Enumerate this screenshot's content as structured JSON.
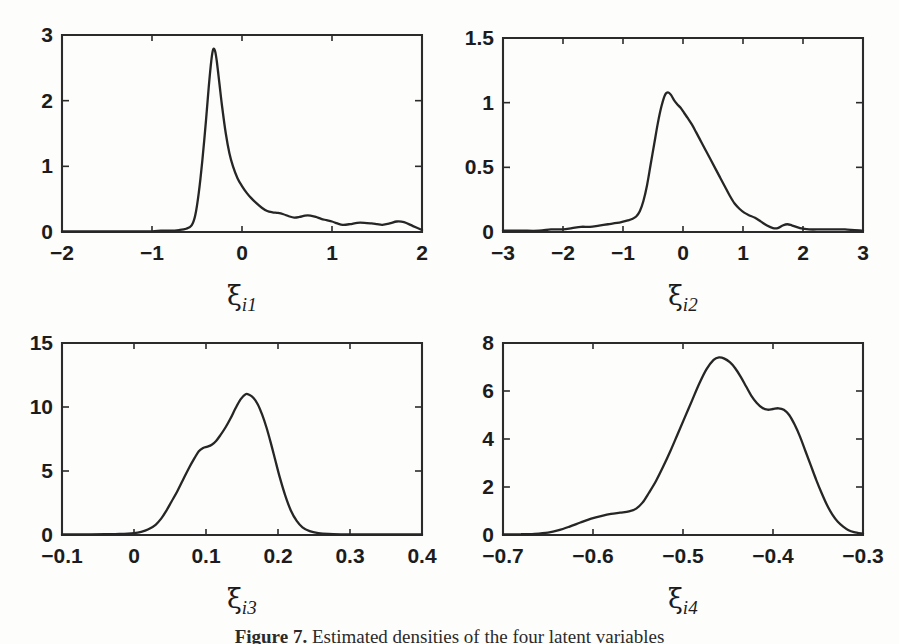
{
  "figure": {
    "background_color": "#fdfdfc",
    "line_color": "#262626",
    "caption_prefix": "Figure",
    "caption_number": "7",
    "caption_text": "Estimated densities of the four latent variables"
  },
  "chart_data": [
    {
      "type": "line",
      "title": "",
      "xlabel": "ξ_i1",
      "xlabel_symbol": "ξ",
      "xlabel_subscript": "i1",
      "ylabel": "",
      "xlim": [
        -2,
        2
      ],
      "ylim": [
        0,
        3
      ],
      "xticks": [
        -2,
        -1,
        0,
        1,
        2
      ],
      "xtick_labels": [
        "−2",
        "−1",
        "0",
        "1",
        "2"
      ],
      "yticks": [
        0,
        1,
        2,
        3
      ],
      "ytick_labels": [
        "0",
        "1",
        "2",
        "3"
      ],
      "grid": false,
      "legend": "none",
      "x": [
        -2.0,
        -1.8,
        -1.6,
        -1.4,
        -1.2,
        -1.0,
        -0.9,
        -0.8,
        -0.7,
        -0.62,
        -0.56,
        -0.52,
        -0.48,
        -0.44,
        -0.4,
        -0.37,
        -0.34,
        -0.32,
        -0.3,
        -0.28,
        -0.25,
        -0.22,
        -0.18,
        -0.14,
        -0.1,
        -0.05,
        0.0,
        0.05,
        0.1,
        0.16,
        0.22,
        0.28,
        0.34,
        0.4,
        0.46,
        0.52,
        0.58,
        0.64,
        0.7,
        0.76,
        0.82,
        0.88,
        0.94,
        1.0,
        1.06,
        1.12,
        1.2,
        1.28,
        1.36,
        1.44,
        1.5,
        1.56,
        1.64,
        1.72,
        1.8,
        1.9,
        2.0
      ],
      "y": [
        0.01,
        0.01,
        0.01,
        0.01,
        0.01,
        0.01,
        0.02,
        0.02,
        0.03,
        0.05,
        0.1,
        0.25,
        0.6,
        1.1,
        1.7,
        2.2,
        2.62,
        2.78,
        2.76,
        2.6,
        2.25,
        1.9,
        1.5,
        1.2,
        1.0,
        0.82,
        0.7,
        0.6,
        0.52,
        0.44,
        0.37,
        0.32,
        0.3,
        0.29,
        0.27,
        0.24,
        0.22,
        0.23,
        0.25,
        0.25,
        0.23,
        0.2,
        0.18,
        0.16,
        0.13,
        0.11,
        0.12,
        0.14,
        0.14,
        0.13,
        0.12,
        0.11,
        0.13,
        0.16,
        0.15,
        0.09,
        0.03
      ]
    },
    {
      "type": "line",
      "title": "",
      "xlabel": "ξ_i2",
      "xlabel_symbol": "ξ",
      "xlabel_subscript": "i2",
      "ylabel": "",
      "xlim": [
        -3,
        3
      ],
      "ylim": [
        0,
        1.5
      ],
      "xticks": [
        -3,
        -2,
        -1,
        0,
        1,
        2,
        3
      ],
      "xtick_labels": [
        "−3",
        "−2",
        "−1",
        "0",
        "1",
        "2",
        "3"
      ],
      "yticks": [
        0,
        0.5,
        1,
        1.5
      ],
      "ytick_labels": [
        "0",
        "0.5",
        "1",
        "1.5"
      ],
      "grid": false,
      "legend": "none",
      "x": [
        -3.0,
        -2.7,
        -2.4,
        -2.2,
        -2.0,
        -1.85,
        -1.7,
        -1.55,
        -1.4,
        -1.25,
        -1.1,
        -1.0,
        -0.92,
        -0.85,
        -0.78,
        -0.72,
        -0.66,
        -0.6,
        -0.54,
        -0.48,
        -0.42,
        -0.36,
        -0.3,
        -0.25,
        -0.2,
        -0.15,
        -0.1,
        -0.04,
        0.02,
        0.08,
        0.15,
        0.22,
        0.3,
        0.38,
        0.46,
        0.54,
        0.62,
        0.7,
        0.78,
        0.86,
        0.94,
        1.02,
        1.1,
        1.2,
        1.3,
        1.4,
        1.5,
        1.58,
        1.66,
        1.74,
        1.82,
        1.95,
        2.1,
        2.3,
        2.5,
        2.7,
        3.0
      ],
      "y": [
        0.01,
        0.01,
        0.01,
        0.02,
        0.02,
        0.03,
        0.04,
        0.04,
        0.05,
        0.06,
        0.07,
        0.08,
        0.09,
        0.1,
        0.12,
        0.16,
        0.24,
        0.36,
        0.52,
        0.68,
        0.84,
        0.97,
        1.06,
        1.08,
        1.06,
        1.02,
        0.99,
        0.96,
        0.92,
        0.88,
        0.83,
        0.77,
        0.7,
        0.63,
        0.56,
        0.49,
        0.42,
        0.35,
        0.28,
        0.22,
        0.18,
        0.15,
        0.13,
        0.11,
        0.08,
        0.05,
        0.03,
        0.03,
        0.05,
        0.06,
        0.05,
        0.03,
        0.02,
        0.02,
        0.02,
        0.02,
        0.01
      ]
    },
    {
      "type": "line",
      "title": "",
      "xlabel": "ξ_i3",
      "xlabel_symbol": "ξ",
      "xlabel_subscript": "i3",
      "ylabel": "",
      "xlim": [
        -0.1,
        0.4
      ],
      "ylim": [
        0,
        15
      ],
      "xticks": [
        -0.1,
        0,
        0.1,
        0.2,
        0.3,
        0.4
      ],
      "xtick_labels": [
        "−0.1",
        "0",
        "0.1",
        "0.2",
        "0.3",
        "0.4"
      ],
      "yticks": [
        0,
        5,
        10,
        15
      ],
      "ytick_labels": [
        "0",
        "5",
        "10",
        "15"
      ],
      "grid": false,
      "legend": "none",
      "x": [
        -0.1,
        -0.08,
        -0.06,
        -0.04,
        -0.02,
        0.0,
        0.01,
        0.02,
        0.03,
        0.038,
        0.045,
        0.052,
        0.06,
        0.068,
        0.076,
        0.084,
        0.09,
        0.096,
        0.102,
        0.108,
        0.114,
        0.12,
        0.127,
        0.134,
        0.141,
        0.148,
        0.155,
        0.16,
        0.166,
        0.172,
        0.178,
        0.184,
        0.19,
        0.196,
        0.202,
        0.21,
        0.218,
        0.226,
        0.234,
        0.244,
        0.256,
        0.27,
        0.29,
        0.31,
        0.34,
        0.37,
        0.4
      ],
      "y": [
        0.05,
        0.05,
        0.05,
        0.06,
        0.08,
        0.15,
        0.25,
        0.45,
        0.8,
        1.3,
        1.9,
        2.6,
        3.4,
        4.3,
        5.2,
        6.0,
        6.55,
        6.8,
        6.9,
        7.05,
        7.35,
        7.8,
        8.4,
        9.1,
        9.9,
        10.6,
        11.0,
        10.95,
        10.7,
        10.2,
        9.4,
        8.4,
        7.2,
        5.9,
        4.6,
        3.1,
        1.9,
        1.1,
        0.6,
        0.3,
        0.15,
        0.08,
        0.05,
        0.04,
        0.04,
        0.04,
        0.04
      ]
    },
    {
      "type": "line",
      "title": "",
      "xlabel": "ξ_i4",
      "xlabel_symbol": "ξ",
      "xlabel_subscript": "i4",
      "ylabel": "",
      "xlim": [
        -0.7,
        -0.3
      ],
      "ylim": [
        0,
        8
      ],
      "xticks": [
        -0.7,
        -0.6,
        -0.5,
        -0.4,
        -0.3
      ],
      "xtick_labels": [
        "−0.7",
        "−0.6",
        "−0.5",
        "−0.4",
        "−0.3"
      ],
      "yticks": [
        0,
        2,
        4,
        6,
        8
      ],
      "ytick_labels": [
        "0",
        "2",
        "4",
        "6",
        "8"
      ],
      "grid": false,
      "legend": "none",
      "x": [
        -0.7,
        -0.68,
        -0.665,
        -0.65,
        -0.638,
        -0.626,
        -0.614,
        -0.602,
        -0.59,
        -0.58,
        -0.57,
        -0.56,
        -0.552,
        -0.545,
        -0.538,
        -0.53,
        -0.522,
        -0.514,
        -0.506,
        -0.498,
        -0.49,
        -0.482,
        -0.474,
        -0.466,
        -0.46,
        -0.454,
        -0.448,
        -0.442,
        -0.436,
        -0.43,
        -0.424,
        -0.418,
        -0.412,
        -0.406,
        -0.4,
        -0.394,
        -0.388,
        -0.382,
        -0.376,
        -0.37,
        -0.364,
        -0.358,
        -0.352,
        -0.346,
        -0.34,
        -0.334,
        -0.328,
        -0.322,
        -0.316,
        -0.31,
        -0.3
      ],
      "y": [
        0.02,
        0.03,
        0.05,
        0.1,
        0.2,
        0.35,
        0.52,
        0.68,
        0.8,
        0.88,
        0.93,
        0.98,
        1.1,
        1.35,
        1.75,
        2.25,
        2.85,
        3.5,
        4.2,
        4.9,
        5.6,
        6.3,
        6.9,
        7.3,
        7.4,
        7.35,
        7.2,
        6.95,
        6.6,
        6.2,
        5.8,
        5.5,
        5.3,
        5.22,
        5.25,
        5.28,
        5.22,
        5.0,
        4.6,
        4.1,
        3.5,
        2.9,
        2.3,
        1.75,
        1.25,
        0.85,
        0.55,
        0.35,
        0.2,
        0.12,
        0.05
      ]
    }
  ],
  "panels": [
    {
      "name": "panel-xi-i1",
      "x": 62,
      "y": 35,
      "w": 360,
      "h": 197
    },
    {
      "name": "panel-xi-i2",
      "x": 503,
      "y": 38,
      "w": 360,
      "h": 194
    },
    {
      "name": "panel-xi-i3",
      "x": 62,
      "y": 343,
      "w": 360,
      "h": 192
    },
    {
      "name": "panel-xi-i4",
      "x": 503,
      "y": 343,
      "w": 360,
      "h": 192
    }
  ]
}
